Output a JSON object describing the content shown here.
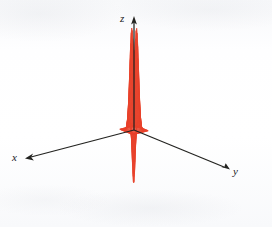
{
  "figure": {
    "kind": "3d-surface-wireframe-plot",
    "background_color": "#fdfdfe",
    "mesh_color": "#e8402a",
    "mesh_fill_color": "#f9c9bf",
    "axis_color": "#232320"
  },
  "axes": {
    "z": {
      "label": "z",
      "name": "z-axis"
    },
    "x": {
      "label": "x",
      "name": "x-axis"
    },
    "y": {
      "label": "y",
      "name": "y-axis"
    }
  },
  "chart_data": {
    "type": "surface",
    "title": "",
    "xlabel": "x",
    "ylabel": "y",
    "zlabel": "z",
    "grid": false,
    "legend": "none",
    "projection": "axonometric",
    "mesh": {
      "u_lines": 40,
      "v_lines": 40,
      "line_color": "#e8402a",
      "face_color": "#f9c9bf"
    },
    "xlim": [
      -3,
      3
    ],
    "ylim": [
      -3,
      3
    ],
    "zlim": [
      -0.6,
      1.05
    ],
    "features": [
      {
        "name": "peak-left",
        "position": [
          -1.0,
          0.0
        ],
        "z": 1.0,
        "description": "tall sharp maximum at back-left"
      },
      {
        "name": "peak-right",
        "position": [
          0.0,
          -1.0
        ],
        "z": 1.0,
        "description": "tall sharp maximum at back-right"
      },
      {
        "name": "central-dip",
        "position": [
          0.0,
          0.0
        ],
        "z": -0.15,
        "description": "narrow funnel depression at the origin"
      },
      {
        "name": "front-trough",
        "position": [
          1.0,
          1.0
        ],
        "z": -0.6,
        "description": "deep downward spike at the front vertex"
      },
      {
        "name": "base-plane",
        "position": [
          0.0,
          0.0
        ],
        "z": 0.0,
        "description": "flat asymptotic plane extending to the domain edges"
      }
    ],
    "ring_contours": [
      {
        "name": "saddle-ridge-front-left",
        "z": 0.12
      },
      {
        "name": "saddle-ridge-front-right",
        "z": 0.12
      }
    ]
  }
}
